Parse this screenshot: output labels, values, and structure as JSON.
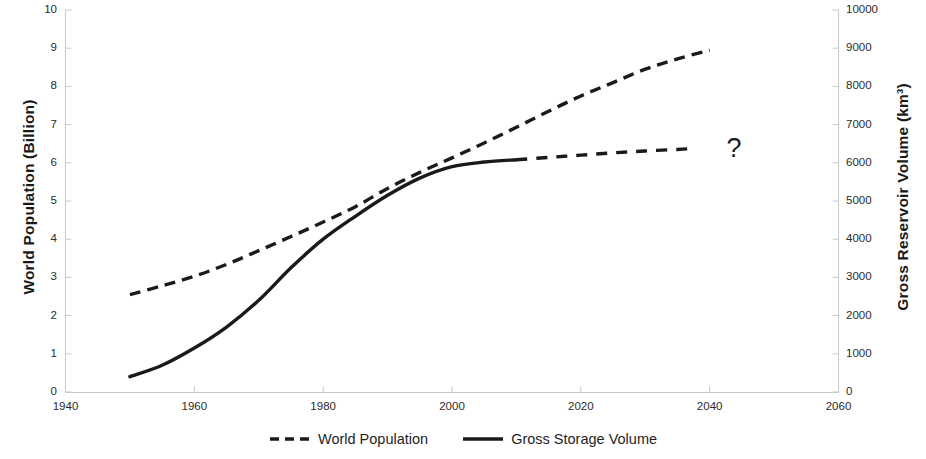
{
  "chart_data": {
    "type": "line",
    "title": "",
    "xlabel": "",
    "ylabel": "World Population (Billion)",
    "y2label": "Gross Reservoir Volume (km³)",
    "xlim": [
      1940,
      2060
    ],
    "ylim": [
      0,
      10
    ],
    "y2lim": [
      0,
      10000
    ],
    "grid": false,
    "legend_position": "bottom-center",
    "x_ticks": [
      "1940",
      "1960",
      "1980",
      "2000",
      "2020",
      "2040",
      "2060"
    ],
    "y_ticks_left": [
      "0",
      "1",
      "2",
      "3",
      "4",
      "5",
      "6",
      "7",
      "8",
      "9",
      "10"
    ],
    "y_ticks_right": [
      "0",
      "1000",
      "2000",
      "3000",
      "4000",
      "5000",
      "6000",
      "7000",
      "8000",
      "9000",
      "10000"
    ],
    "annotations": [
      {
        "text": "?",
        "x": 2044,
        "y": 6.3
      }
    ],
    "series": [
      {
        "name": "World Population",
        "axis": "left",
        "style": "dashed",
        "color": "#1a1a1a",
        "x": [
          1950,
          1955,
          1960,
          1965,
          1970,
          1975,
          1980,
          1985,
          1990,
          1995,
          2000,
          2005,
          2010,
          2015,
          2020,
          2025,
          2030,
          2035,
          2040
        ],
        "values": [
          2.55,
          2.78,
          3.03,
          3.34,
          3.7,
          4.07,
          4.45,
          4.85,
          5.33,
          5.75,
          6.13,
          6.52,
          6.93,
          7.35,
          7.75,
          8.1,
          8.45,
          8.72,
          8.95
        ]
      },
      {
        "name": "Gross Storage Volume",
        "axis": "right",
        "style": "solid",
        "color": "#1a1a1a",
        "x": [
          1950,
          1955,
          1960,
          1965,
          1970,
          1975,
          1980,
          1985,
          1990,
          1995,
          2000,
          2005,
          2010
        ],
        "values": [
          400,
          700,
          1150,
          1700,
          2400,
          3250,
          4000,
          4600,
          5150,
          5600,
          5900,
          6020,
          6080
        ]
      },
      {
        "name": "Gross Storage Volume (projected)",
        "axis": "right",
        "style": "dashed",
        "color": "#1a1a1a",
        "x": [
          2010,
          2015,
          2020,
          2025,
          2030,
          2035,
          2037
        ],
        "values": [
          6080,
          6140,
          6200,
          6260,
          6310,
          6350,
          6370
        ]
      }
    ]
  },
  "axes": {
    "left_title": "World Population (Billion)",
    "right_title": "Gross Reservoir Volume (km³)"
  },
  "legend": {
    "items": [
      {
        "label": "World Population",
        "style": "dashed"
      },
      {
        "label": "Gross Storage Volume",
        "style": "solid"
      }
    ]
  },
  "annotation": {
    "question_mark": "?"
  }
}
